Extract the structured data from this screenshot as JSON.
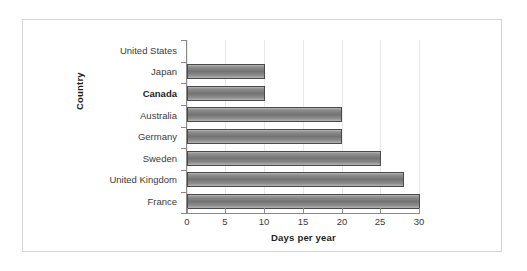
{
  "chart_data": {
    "type": "bar",
    "orientation": "horizontal",
    "title": "",
    "xlabel": "Days per year",
    "ylabel": "Country",
    "categories": [
      "United States",
      "Japan",
      "Canada",
      "Australia",
      "Germany",
      "Sweden",
      "United Kingdom",
      "France"
    ],
    "values": [
      0,
      10,
      10,
      20,
      20,
      25,
      28,
      30
    ],
    "xlim": [
      0,
      30
    ],
    "xticks": [
      "0",
      "5",
      "10",
      "15",
      "20",
      "25",
      "30"
    ],
    "xtick_values": [
      0,
      5,
      10,
      15,
      20,
      25,
      30
    ],
    "grid": "vertical-only",
    "legend": "none",
    "highlighted_category": "Canada",
    "colors": {
      "bar_fill_top": "#b9b9b9",
      "bar_fill_mid": "#737373",
      "bar_border": "#4a4a4a",
      "axis": "#8a8a8a",
      "gridline": "#e8e8e8",
      "frame": "#d3d3d3",
      "background": "#ffffff",
      "text": "#3b3b3b"
    }
  }
}
